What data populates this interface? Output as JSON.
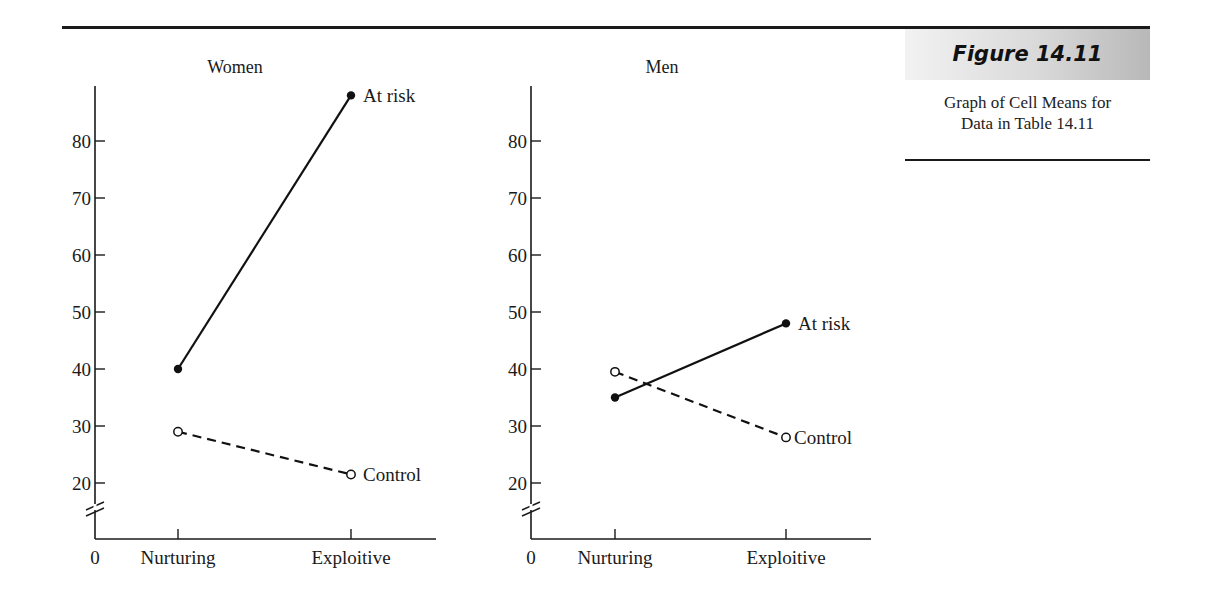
{
  "figure": {
    "label": "Figure 14.11",
    "caption_line1": "Graph of Cell Means for",
    "caption_line2": "Data in Table 14.11"
  },
  "chart_data": [
    {
      "type": "line",
      "title": "Women",
      "categories": [
        "Nurturing",
        "Exploitive"
      ],
      "x_origin_label": "0",
      "series": [
        {
          "name": "At risk",
          "style": "solid",
          "marker": "filled-circle",
          "values": [
            40,
            88
          ]
        },
        {
          "name": "Control",
          "style": "dashed",
          "marker": "open-circle",
          "values": [
            29,
            21.5
          ]
        }
      ],
      "yticks": [
        20,
        30,
        40,
        50,
        60,
        70,
        80
      ],
      "ylim": [
        0,
        90
      ],
      "axis_break": true,
      "grid": false,
      "xlabel": "",
      "ylabel": ""
    },
    {
      "type": "line",
      "title": "Men",
      "categories": [
        "Nurturing",
        "Exploitive"
      ],
      "x_origin_label": "0",
      "series": [
        {
          "name": "At risk",
          "style": "solid",
          "marker": "filled-circle",
          "values": [
            35,
            48
          ]
        },
        {
          "name": "Control",
          "style": "dashed",
          "marker": "open-circle",
          "values": [
            39.5,
            28
          ]
        }
      ],
      "yticks": [
        20,
        30,
        40,
        50,
        60,
        70,
        80
      ],
      "ylim": [
        0,
        90
      ],
      "axis_break": true,
      "grid": false,
      "xlabel": "",
      "ylabel": ""
    }
  ]
}
